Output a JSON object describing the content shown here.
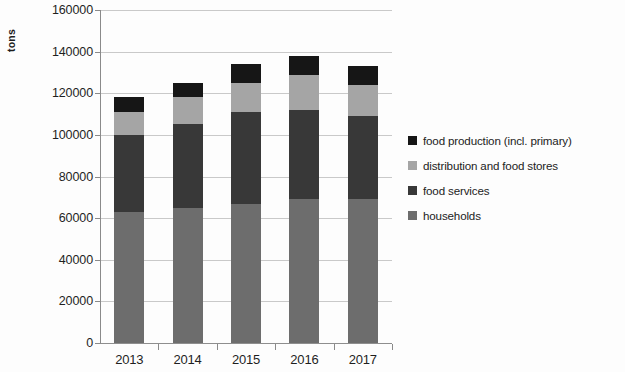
{
  "chart_data": {
    "type": "bar",
    "subtype": "stacked-column",
    "title": "",
    "xlabel": "",
    "ylabel": "tons",
    "categories": [
      "2013",
      "2014",
      "2015",
      "2016",
      "2017"
    ],
    "ylim": [
      0,
      160000
    ],
    "ytick_values": [
      0,
      20000,
      40000,
      60000,
      80000,
      100000,
      120000,
      140000,
      160000
    ],
    "ytick_labels": [
      "0",
      "20000",
      "40000",
      "60000",
      "80000",
      "100000",
      "120000",
      "140000",
      "160000"
    ],
    "grid": true,
    "legend_position": "right",
    "stack_order_bottom_to_top": [
      "households",
      "food services",
      "distribution and food stores",
      "food production (incl. primary)"
    ],
    "series": [
      {
        "name": "households",
        "key": "households",
        "color": "#6d6d6d",
        "values": [
          63000,
          65000,
          67000,
          69000,
          69000
        ]
      },
      {
        "name": "food services",
        "key": "food_services",
        "color": "#383838",
        "values": [
          37000,
          40000,
          44000,
          43000,
          40000
        ]
      },
      {
        "name": "distribution and food stores",
        "key": "distribution",
        "color": "#a5a5a5",
        "values": [
          11000,
          13000,
          14000,
          17000,
          15000
        ]
      },
      {
        "name": "food production (incl. primary)",
        "key": "food_production",
        "color": "#161616",
        "values": [
          7000,
          7000,
          9000,
          9000,
          9000
        ]
      }
    ],
    "totals": [
      118000,
      125000,
      134000,
      138000,
      133000
    ]
  },
  "legend": {
    "items": [
      {
        "label": "food production (incl. primary)",
        "color": "#161616"
      },
      {
        "label": "distribution and food stores",
        "color": "#a5a5a5"
      },
      {
        "label": "food services",
        "color": "#383838"
      },
      {
        "label": "households",
        "color": "#6d6d6d"
      }
    ]
  },
  "axes": {
    "y_title": "tons"
  }
}
